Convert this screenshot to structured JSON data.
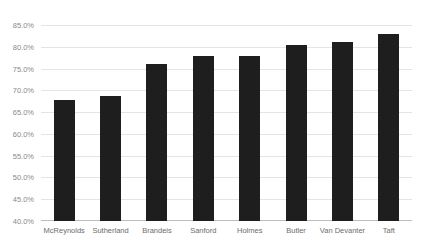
{
  "title_fragment": "",
  "colors": {
    "bar": "#1e1e1e",
    "gridline": "#e4e4e4",
    "axis": "#bdbdbd",
    "tick_text": "#8a8a8a",
    "category_text": "#6d6d6d",
    "background": "#ffffff"
  },
  "chart_data": {
    "type": "bar",
    "title": "",
    "subtitle": "",
    "xlabel": "",
    "ylabel": "",
    "categories": [
      "McReynolds",
      "Sutherland",
      "Brandeis",
      "Sanford",
      "Holmes",
      "Butler",
      "Van Devanter",
      "Taft"
    ],
    "values": [
      67.7,
      68.8,
      76.0,
      77.8,
      77.8,
      80.3,
      81.2,
      82.9
    ],
    "value_labels": [
      "67.7%",
      "68.8%",
      "76.0%",
      "77.8%",
      "77.8%",
      "80.3%",
      "81.2%",
      "82.9%"
    ],
    "ylim": [
      40.0,
      85.0
    ],
    "ytick_values": [
      85.0,
      80.0,
      75.0,
      70.0,
      65.0,
      60.0,
      55.0,
      50.0,
      45.0,
      40.0
    ],
    "ytick_labels": [
      "85.0%",
      "80.0%",
      "75.0%",
      "70.0%",
      "65.0%",
      "60.0%",
      "55.0%",
      "50.0%",
      "45.0%",
      "40.0%"
    ],
    "grid": true,
    "grid_axis": "y",
    "legend": false,
    "legend_position": "none",
    "series": [
      {
        "name": "",
        "values": [
          67.7,
          68.8,
          76.0,
          77.8,
          77.8,
          80.3,
          81.2,
          82.9
        ]
      }
    ]
  }
}
